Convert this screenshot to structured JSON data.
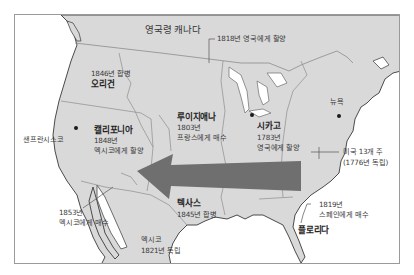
{
  "map": {
    "colors": {
      "land": "#d9d9d9",
      "water": "#ffffff",
      "border": "#8c8c8c",
      "coast": "#4a4a4a",
      "arrow": "#6f6f6f",
      "frame": "#9a9a9a"
    },
    "regions": {
      "canada": {
        "name": "영국령 캐나다"
      },
      "cession_1818": {
        "note": "1818년 영국에게 할양"
      },
      "oregon": {
        "name": "오리건",
        "note": "1846년 합병"
      },
      "california": {
        "name": "캘리포니아",
        "year": "1848년",
        "note": "멕시코에게 할양"
      },
      "louisiana": {
        "name": "루이지애나",
        "year": "1803년",
        "note": "프랑스에게 매수"
      },
      "chicago": {
        "name": "시카고",
        "year": "1783년",
        "note": "영국에게 할양"
      },
      "thirteen_colonies": {
        "name": "미국 13개 주",
        "note": "(1776년 독립)"
      },
      "new_york": {
        "name": "뉴욕"
      },
      "san_francisco": {
        "name": "샌프란시스코"
      },
      "texas": {
        "name": "텍사스",
        "note": "1845년 합병"
      },
      "gadsden": {
        "year": "1853년",
        "note": "멕시코에게 매수"
      },
      "mexico": {
        "name": "멕시코",
        "note": "1821년 독립"
      },
      "florida": {
        "name": "플로리다",
        "year": "1819년",
        "note": "스페인에게 매수"
      }
    },
    "arrow": {
      "direction": "west",
      "meaning": "westward-expansion"
    }
  }
}
